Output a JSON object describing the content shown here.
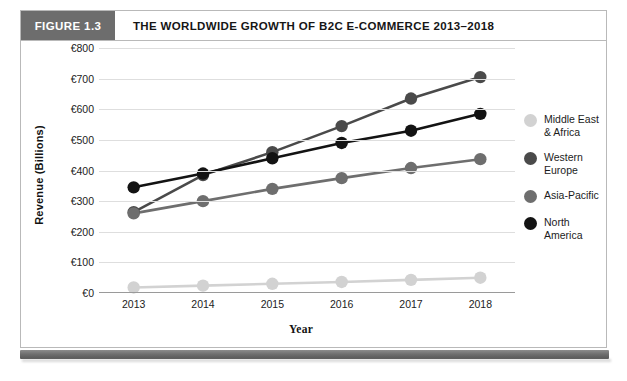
{
  "figure": {
    "badge_label": "FIGURE 1.3",
    "title": "THE WORLDWIDE GROWTH OF B2C E-COMMERCE 2013–2018",
    "badge_color": "#6d6d6d"
  },
  "chart_data": {
    "type": "line",
    "title": "THE WORLDWIDE GROWTH OF B2C E-COMMERCE 2013–2018",
    "xlabel": "Year",
    "ylabel": "Revenue (Billions)",
    "categories": [
      "2013",
      "2014",
      "2015",
      "2016",
      "2017",
      "2018"
    ],
    "ylim": [
      0,
      800
    ],
    "ytick_values": [
      0,
      100,
      200,
      300,
      400,
      500,
      600,
      700,
      800
    ],
    "ytick_labels": [
      "€0",
      "€100",
      "€200",
      "€300",
      "€400",
      "€500",
      "€600",
      "€700",
      "€800"
    ],
    "grid": true,
    "legend_position": "right",
    "series": [
      {
        "name": "Middle East\n& Africa",
        "legend_label": "Middle East\n& Africa",
        "color": "#d2d2d2",
        "values": [
          18,
          24,
          30,
          36,
          43,
          50
        ]
      },
      {
        "name": "Western Europe",
        "legend_label": "Western\nEurope",
        "color": "#4a4a4a",
        "values": [
          264,
          385,
          460,
          545,
          635,
          705
        ]
      },
      {
        "name": "Asia-Pacific",
        "legend_label": "Asia-Pacific",
        "color": "#6e6e6e",
        "values": [
          260,
          300,
          340,
          375,
          408,
          437
        ]
      },
      {
        "name": "North America",
        "legend_label": "North America",
        "color": "#131313",
        "values": [
          345,
          390,
          440,
          490,
          530,
          585
        ]
      }
    ]
  }
}
